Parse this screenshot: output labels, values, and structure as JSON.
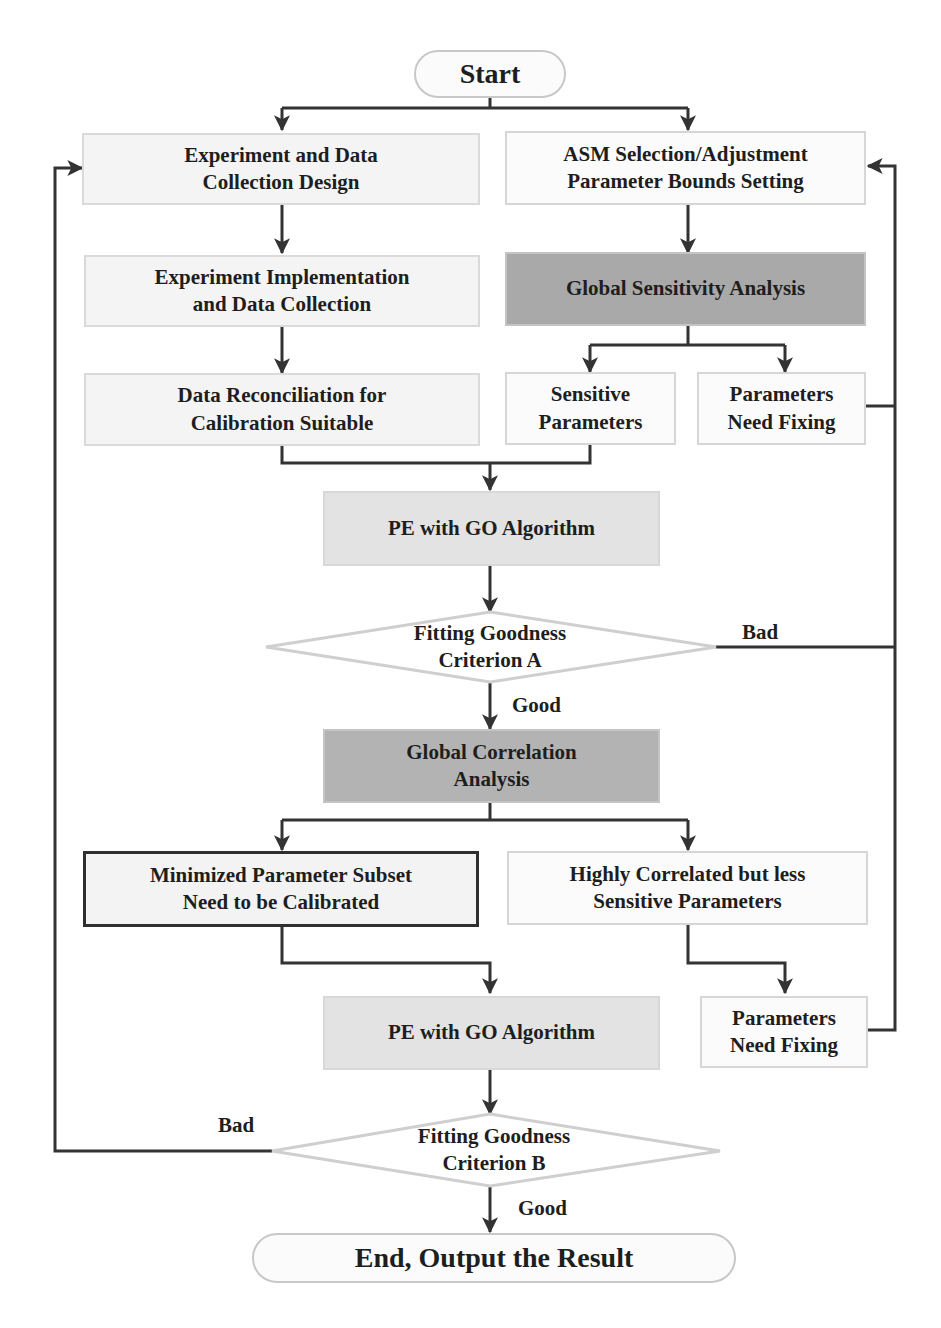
{
  "diagram": {
    "type": "flowchart",
    "colors": {
      "line": "#333333",
      "box_light": "#f4f4f4",
      "box_mid": "#e3e3e3",
      "box_dark": "#a9a9a9",
      "border_light": "#d6d6d6",
      "border_bold": "#2f2f2f"
    },
    "nodes": {
      "start": "Start",
      "exp_design_1": "Experiment and Data",
      "exp_design_2": "Collection Design",
      "asm_1": "ASM Selection/Adjustment",
      "asm_2": "Parameter Bounds Setting",
      "exp_impl_1": "Experiment Implementation",
      "exp_impl_2": "and Data Collection",
      "gsa": "Global Sensitivity Analysis",
      "data_recon_1": "Data Reconciliation for",
      "data_recon_2": "Calibration Suitable",
      "sensitive_1": "Sensitive",
      "sensitive_2": "Parameters",
      "fix1_1": "Parameters",
      "fix1_2": "Need Fixing",
      "pe1": "PE with GO Algorithm",
      "crit_a_1": "Fitting Goodness",
      "crit_a_2": "Criterion A",
      "gca_1": "Global Correlation",
      "gca_2": "Analysis",
      "subset_1": "Minimized Parameter Subset",
      "subset_2": "Need to be Calibrated",
      "highcorr_1": "Highly Correlated but less",
      "highcorr_2": "Sensitive Parameters",
      "pe2": "PE with GO Algorithm",
      "fix2_1": "Parameters",
      "fix2_2": "Need Fixing",
      "crit_b_1": "Fitting Goodness",
      "crit_b_2": "Criterion B",
      "end": "End, Output the Result"
    },
    "edge_labels": {
      "a_bad": "Bad",
      "a_good": "Good",
      "b_bad": "Bad",
      "b_good": "Good"
    }
  }
}
